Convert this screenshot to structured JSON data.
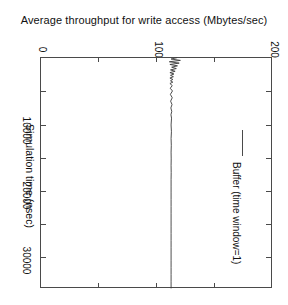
{
  "chart_data": {
    "type": "line",
    "title": "Average throughput for write access (Mbytes/sec)",
    "xlabel": "Simulation time (nsec)",
    "ylabel": "Average throughput for write access (Mbytes/sec)",
    "orientation": "rotated-90-clockwise",
    "grid": false,
    "legend_position": "right-inside",
    "value_axis": {
      "label": "",
      "ticks": [
        0,
        100,
        200
      ],
      "tick_labels": [
        "0",
        "100",
        "200"
      ],
      "lim": [
        0,
        200
      ]
    },
    "time_axis": {
      "label": "Simulation time (nsec)",
      "ticks": [
        10000,
        20000,
        30000
      ],
      "tick_labels": [
        "10000",
        "20000",
        "30000"
      ],
      "lim": [
        0,
        34000
      ],
      "minor_ticks": [
        5000,
        15000,
        25000
      ]
    },
    "series": [
      {
        "name": "Buffer (time window=1)",
        "x": [
          100,
          300,
          500,
          700,
          900,
          1100,
          1300,
          1500,
          1700,
          1900,
          2100,
          2300,
          2500,
          2700,
          2900,
          3100,
          3300,
          3500,
          3700,
          3900,
          4200,
          4600,
          5000,
          5500,
          6000,
          6500,
          7000,
          7500,
          8000,
          8500,
          9000,
          10000,
          11000,
          12000,
          13000,
          14000,
          15000,
          16000,
          17000,
          18000,
          19000,
          20000,
          21000,
          22000,
          23000,
          24000,
          25000,
          26000,
          27000,
          28000,
          29000,
          30000,
          31000,
          32000,
          33000,
          34000
        ],
        "values": [
          118.0,
          113.0,
          121.0,
          111.5,
          120.0,
          112.0,
          118.5,
          113.5,
          117.5,
          112.5,
          116.5,
          112.0,
          115.5,
          112.5,
          115.0,
          112.0,
          114.5,
          112.5,
          114.5,
          112.0,
          114.0,
          112.3,
          114.2,
          112.4,
          114.0,
          112.6,
          113.8,
          112.8,
          113.6,
          112.9,
          113.4,
          113.0,
          113.3,
          113.0,
          113.2,
          113.0,
          113.1,
          113.0,
          113.1,
          113.0,
          113.0,
          113.0,
          113.0,
          113.0,
          113.0,
          113.0,
          113.0,
          113.0,
          113.0,
          113.0,
          113.0,
          113.0,
          113.0,
          113.0,
          113.0,
          113.0
        ],
        "color": "#3b3b3b",
        "style": "solid"
      }
    ],
    "legend": [
      {
        "label": "Buffer (time window=1)",
        "color": "#3b3b3b"
      }
    ]
  },
  "colors": {
    "axis": "#4a4a4a",
    "text": "#111111",
    "series": "#3b3b3b",
    "background": "#ffffff"
  }
}
